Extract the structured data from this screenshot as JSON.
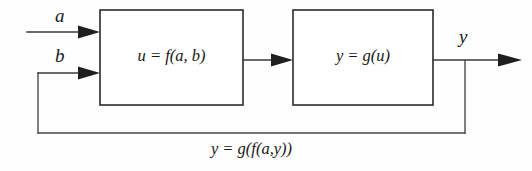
{
  "diagram": {
    "background_color": "#fefefe",
    "line_color": "#3a3a3a",
    "text_color": "#181818",
    "blocks": [
      {
        "id": "forward-block",
        "expression": "u = f(a, b)",
        "x": 100,
        "y": 10,
        "width": 143,
        "height": 95
      },
      {
        "id": "output-block",
        "expression": "y = g(u)",
        "x": 293,
        "y": 10,
        "width": 140,
        "height": 95
      }
    ],
    "signals": {
      "input_a": "a",
      "input_b": "b",
      "output_y": "y"
    },
    "feedback_caption": "y = g(f(a,y))"
  }
}
